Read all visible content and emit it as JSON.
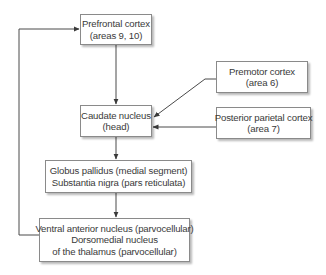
{
  "diagram": {
    "type": "flowchart",
    "nodes": [
      {
        "id": "prefrontal",
        "lines": [
          "Prefrontal cortex",
          "(areas 9, 10)"
        ]
      },
      {
        "id": "premotor",
        "lines": [
          "Premotor cortex",
          "(area 6)"
        ]
      },
      {
        "id": "caudate",
        "lines": [
          "Caudate nucleus",
          "(head)"
        ]
      },
      {
        "id": "posterior_parietal",
        "lines": [
          "Posterior parietal cortex",
          "(area 7)"
        ]
      },
      {
        "id": "globus",
        "lines": [
          "Globus pallidus (medial segment)",
          "Substantia nigra (pars reticulata)"
        ]
      },
      {
        "id": "thalamus",
        "lines": [
          "Ventral anterior nucleus (parvocellular)",
          "Dorsomedial nucleus",
          "of the thalamus (parvocellular)"
        ]
      }
    ],
    "edges": [
      {
        "from": "prefrontal",
        "to": "caudate"
      },
      {
        "from": "premotor",
        "to": "caudate"
      },
      {
        "from": "posterior_parietal",
        "to": "caudate"
      },
      {
        "from": "caudate",
        "to": "globus"
      },
      {
        "from": "globus",
        "to": "thalamus"
      },
      {
        "from": "thalamus",
        "to": "prefrontal"
      }
    ],
    "colors": {
      "line": "#4a4a4a",
      "border": "#8a8a8a",
      "text": "#3a3a3a",
      "background": "#ffffff"
    }
  }
}
